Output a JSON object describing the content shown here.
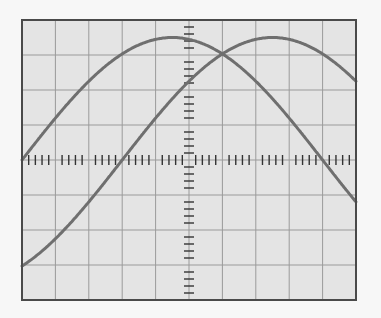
{
  "screen": {
    "name": "oscilloscope-screen",
    "divisions_x": 10,
    "divisions_y": 8,
    "minor_ticks_per_division": 5,
    "rect": {
      "left": 22,
      "top": 20,
      "right": 356,
      "bottom": 300
    },
    "colors": {
      "page_background": "#f7f7f7",
      "screen_background": "#e4e4e4",
      "grid_line": "#9a9a9a",
      "border": "#4a4a4a",
      "axis_ticks": "#333333",
      "trace": "#6f6f6f"
    }
  },
  "traces": [
    {
      "name": "trace-1",
      "type": "sine",
      "amplitude_div": 3.5,
      "half_period_div": 9.0,
      "zero_crossing_rising_div_x": 0.0,
      "description": "starts at center-left rising, peaks near center, falls past center line at 9 div"
    },
    {
      "name": "trace-2",
      "type": "sine",
      "amplitude_div": 3.5,
      "half_period_div": 9.0,
      "zero_crossing_rising_div_x": 3.0,
      "description": "phase-shifted copy of trace-1, lagging by 3 divisions"
    }
  ]
}
